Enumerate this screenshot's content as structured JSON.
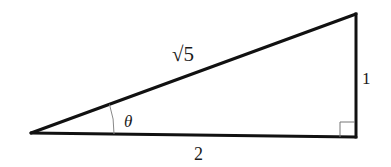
{
  "diagram": {
    "type": "right-triangle",
    "vertices": {
      "left": [
        31,
        133
      ],
      "top_right": [
        356,
        14
      ],
      "bottom_right": [
        356,
        137
      ]
    },
    "labels": {
      "hypotenuse": "√5",
      "opposite": "1",
      "adjacent": "2",
      "angle": "θ"
    },
    "right_angle_marker": true,
    "colors": {
      "stroke": "#111111",
      "arc": "#888888",
      "marker": "#777777",
      "text": "#1a1a1a"
    }
  }
}
